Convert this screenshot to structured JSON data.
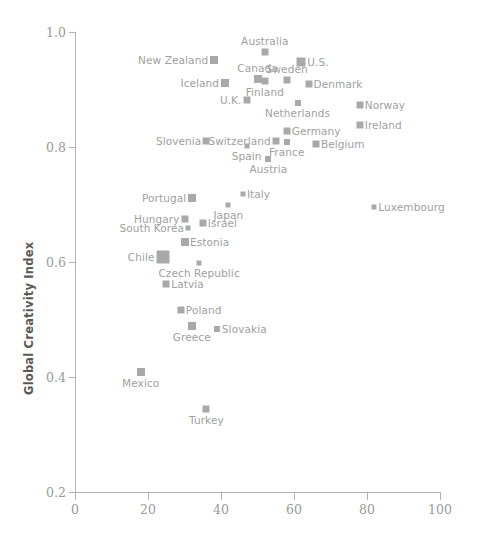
{
  "chart_data": {
    "type": "scatter",
    "title": "",
    "xlabel": "",
    "ylabel": "Global Creativity Index",
    "xlim": [
      0,
      100
    ],
    "ylim": [
      0.2,
      1.0
    ],
    "xticks": [
      "0",
      "20",
      "40",
      "60",
      "80",
      "100"
    ],
    "yticks": [
      "1.0",
      "0.8",
      "0.6",
      "0.4",
      "0.2"
    ],
    "grid": false,
    "legend": "none",
    "marker_color": "#a9a9a9",
    "label_color": "#a0a0a0",
    "axis_color": "#b3b3b3",
    "points": [
      {
        "name": "Australia",
        "x": 52,
        "y": 0.965,
        "size": 7,
        "label_pos": "above"
      },
      {
        "name": "New Zealand",
        "x": 38,
        "y": 0.952,
        "size": 8,
        "label_pos": "left"
      },
      {
        "name": "U.S.",
        "x": 62,
        "y": 0.948,
        "size": 9,
        "label_pos": "right"
      },
      {
        "name": "Canada",
        "x": 50,
        "y": 0.918,
        "size": 8,
        "label_pos": "above"
      },
      {
        "name": "Sweden",
        "x": 58,
        "y": 0.916,
        "size": 7,
        "label_pos": "above"
      },
      {
        "name": "Finland",
        "x": 52,
        "y": 0.914,
        "size": 7,
        "label_pos": "below"
      },
      {
        "name": "Iceland",
        "x": 41,
        "y": 0.912,
        "size": 8,
        "label_pos": "left"
      },
      {
        "name": "Denmark",
        "x": 64,
        "y": 0.909,
        "size": 7,
        "label_pos": "right"
      },
      {
        "name": "Netherlands",
        "x": 61,
        "y": 0.877,
        "size": 6,
        "label_pos": "below"
      },
      {
        "name": "U.K.",
        "x": 47,
        "y": 0.881,
        "size": 7,
        "label_pos": "left"
      },
      {
        "name": "Norway",
        "x": 78,
        "y": 0.873,
        "size": 7,
        "label_pos": "right"
      },
      {
        "name": "Ireland",
        "x": 78,
        "y": 0.839,
        "size": 7,
        "label_pos": "right"
      },
      {
        "name": "Germany",
        "x": 58,
        "y": 0.828,
        "size": 7,
        "label_pos": "right"
      },
      {
        "name": "Slovenia",
        "x": 36,
        "y": 0.811,
        "size": 7,
        "label_pos": "left"
      },
      {
        "name": "Switzerland",
        "x": 55,
        "y": 0.811,
        "size": 7,
        "label_pos": "left"
      },
      {
        "name": "France",
        "x": 58,
        "y": 0.809,
        "size": 6,
        "label_pos": "below"
      },
      {
        "name": "Belgium",
        "x": 66,
        "y": 0.805,
        "size": 7,
        "label_pos": "right"
      },
      {
        "name": "Spain",
        "x": 47,
        "y": 0.801,
        "size": 5,
        "label_pos": "below"
      },
      {
        "name": "Austria",
        "x": 53,
        "y": 0.78,
        "size": 6,
        "label_pos": "below"
      },
      {
        "name": "Italy",
        "x": 46,
        "y": 0.719,
        "size": 5,
        "label_pos": "right"
      },
      {
        "name": "Portugal",
        "x": 32,
        "y": 0.712,
        "size": 8,
        "label_pos": "left"
      },
      {
        "name": "Japan",
        "x": 42,
        "y": 0.699,
        "size": 5,
        "label_pos": "below"
      },
      {
        "name": "Luxembourg",
        "x": 82,
        "y": 0.695,
        "size": 5,
        "label_pos": "right"
      },
      {
        "name": "Hungary",
        "x": 30,
        "y": 0.674,
        "size": 7,
        "label_pos": "left"
      },
      {
        "name": "Israel",
        "x": 35,
        "y": 0.668,
        "size": 7,
        "label_pos": "right"
      },
      {
        "name": "South Korea",
        "x": 31,
        "y": 0.659,
        "size": 5,
        "label_pos": "left"
      },
      {
        "name": "Estonia",
        "x": 30,
        "y": 0.635,
        "size": 8,
        "label_pos": "right"
      },
      {
        "name": "Chile",
        "x": 24,
        "y": 0.609,
        "size": 13,
        "label_pos": "left"
      },
      {
        "name": "Czech Republic",
        "x": 34,
        "y": 0.598,
        "size": 5,
        "label_pos": "below"
      },
      {
        "name": "Latvia",
        "x": 25,
        "y": 0.562,
        "size": 7,
        "label_pos": "right"
      },
      {
        "name": "Poland",
        "x": 29,
        "y": 0.516,
        "size": 7,
        "label_pos": "right"
      },
      {
        "name": "Greece",
        "x": 32,
        "y": 0.489,
        "size": 8,
        "label_pos": "below"
      },
      {
        "name": "Slovakia",
        "x": 39,
        "y": 0.484,
        "size": 6,
        "label_pos": "right"
      },
      {
        "name": "Mexico",
        "x": 18,
        "y": 0.409,
        "size": 8,
        "label_pos": "below"
      },
      {
        "name": "Turkey",
        "x": 36,
        "y": 0.345,
        "size": 7,
        "label_pos": "below"
      }
    ]
  }
}
